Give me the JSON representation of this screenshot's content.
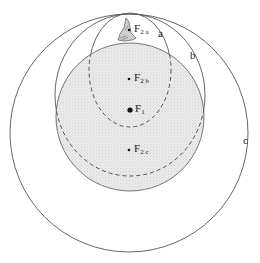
{
  "diagram": {
    "colors": {
      "stroke": "#444444",
      "fill": "#e6e6e6",
      "text": "#222222"
    },
    "foci": [
      {
        "id": "F1",
        "base": "F",
        "sub": "1",
        "x": 130,
        "y": 110,
        "r": 2.6
      },
      {
        "id": "F2a",
        "base": "F",
        "sub": "2 a",
        "x": 129,
        "y": 30,
        "r": 1.3
      },
      {
        "id": "F2b",
        "base": "F",
        "sub": "2 b",
        "x": 129,
        "y": 79,
        "r": 1.3
      },
      {
        "id": "F2c",
        "base": "F",
        "sub": "2 c",
        "x": 129,
        "y": 150,
        "r": 1.3
      }
    ],
    "curve_labels": [
      {
        "id": "a",
        "text": "a",
        "x": 158,
        "y": 28
      },
      {
        "id": "b",
        "text": "b",
        "x": 190,
        "y": 50
      },
      {
        "id": "c",
        "text": "c",
        "x": 243,
        "y": 135
      }
    ],
    "shapes": {
      "circle_c": {
        "cx": 129,
        "cy": 133,
        "r": 119
      },
      "shaded_circle": {
        "cx": 130,
        "cy": 117,
        "r": 74
      },
      "ellipse_a": {
        "cx": 130,
        "cy": 70,
        "rx": 41,
        "ry": 57
      },
      "ellipse_b": {
        "cx": 130,
        "cy": 95,
        "rx": 75,
        "ry": 81
      }
    }
  }
}
